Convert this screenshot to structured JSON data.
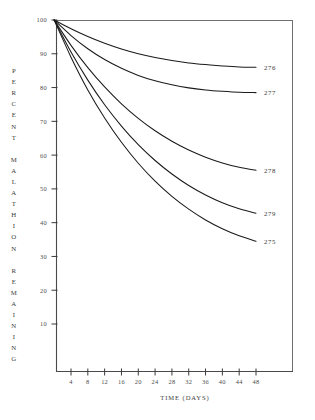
{
  "chart_data": {
    "type": "line",
    "title": "",
    "xlabel": "TIME (DAYS)",
    "ylabel": "PERCENT MALATHION REMAINING",
    "ylabel_words": [
      "PERCENT",
      "MALATHION",
      "REMAINING"
    ],
    "xlim": [
      0,
      52
    ],
    "ylim": [
      0,
      100
    ],
    "grid": false,
    "legend_position": "right-inline-labels",
    "x_ticks": [
      4,
      8,
      12,
      16,
      20,
      24,
      28,
      32,
      36,
      40,
      44,
      48
    ],
    "x_tick_labels": [
      "4",
      "8",
      "12",
      "16",
      "20",
      "24",
      "28",
      "32",
      "36",
      "40",
      "44",
      "48"
    ],
    "y_ticks": [
      10,
      20,
      30,
      40,
      50,
      60,
      70,
      80,
      90,
      100
    ],
    "y_tick_labels": [
      "10",
      "20",
      "30",
      "40",
      "50",
      "60",
      "70",
      "80",
      "90",
      "100"
    ],
    "x": [
      0,
      4,
      8,
      12,
      16,
      20,
      24,
      28,
      32,
      36,
      40,
      44,
      48
    ],
    "series": [
      {
        "name": "276",
        "label": "276",
        "color": "#1a1a1a",
        "values": [
          100.0,
          97.4,
          95.1,
          93.1,
          91.4,
          90.0,
          88.9,
          88.0,
          87.3,
          86.8,
          86.4,
          86.1,
          86.0
        ]
      },
      {
        "name": "277",
        "label": "277",
        "color": "#1a1a1a",
        "values": [
          100.0,
          95.4,
          91.5,
          88.3,
          85.7,
          83.6,
          82.0,
          80.8,
          79.9,
          79.3,
          78.9,
          78.6,
          78.5
        ]
      },
      {
        "name": "278",
        "label": "278",
        "color": "#1a1a1a",
        "values": [
          100.0,
          92.5,
          85.9,
          80.2,
          75.2,
          70.9,
          67.2,
          64.1,
          61.5,
          59.4,
          57.7,
          56.4,
          55.5
        ]
      },
      {
        "name": "279",
        "label": "279",
        "color": "#1a1a1a",
        "values": [
          100.0,
          90.5,
          82.2,
          74.9,
          68.6,
          63.1,
          58.4,
          54.4,
          51.0,
          48.2,
          45.9,
          44.1,
          42.8
        ]
      },
      {
        "name": "275",
        "label": "275",
        "color": "#1a1a1a",
        "values": [
          100.0,
          89.0,
          79.3,
          71.0,
          63.8,
          57.6,
          52.3,
          47.8,
          44.0,
          40.8,
          38.2,
          36.1,
          34.5
        ]
      }
    ],
    "annotations": [
      {
        "text": "276",
        "x": 48,
        "y": 86.0
      },
      {
        "text": "277",
        "x": 48,
        "y": 78.5
      },
      {
        "text": "278",
        "x": 48,
        "y": 55.5
      },
      {
        "text": "279",
        "x": 48,
        "y": 42.8
      },
      {
        "text": "275",
        "x": 48,
        "y": 34.5
      }
    ]
  },
  "colors": {
    "curve": "#1a1a1a",
    "axis": "#4a4a4a",
    "frame": "#6e6e6e",
    "text": "#3d3d3d",
    "background": "#ffffff"
  }
}
